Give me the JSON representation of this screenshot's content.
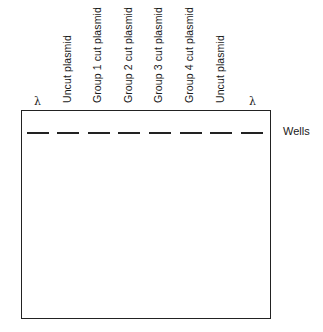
{
  "diagram": {
    "lanes": [
      {
        "label": "λ",
        "type": "marker"
      },
      {
        "label": "Uncut plasmid",
        "type": "sample"
      },
      {
        "label": "Group 1 cut plasmid",
        "type": "sample"
      },
      {
        "label": "Group 2 cut plasmid",
        "type": "sample"
      },
      {
        "label": "Group 3 cut plasmid",
        "type": "sample"
      },
      {
        "label": "Group 4 cut plasmid",
        "type": "sample"
      },
      {
        "label": "Uncut plasmid",
        "type": "sample"
      },
      {
        "label": "λ",
        "type": "marker"
      }
    ],
    "wells_label": "Wells",
    "line_color": "#222222"
  }
}
